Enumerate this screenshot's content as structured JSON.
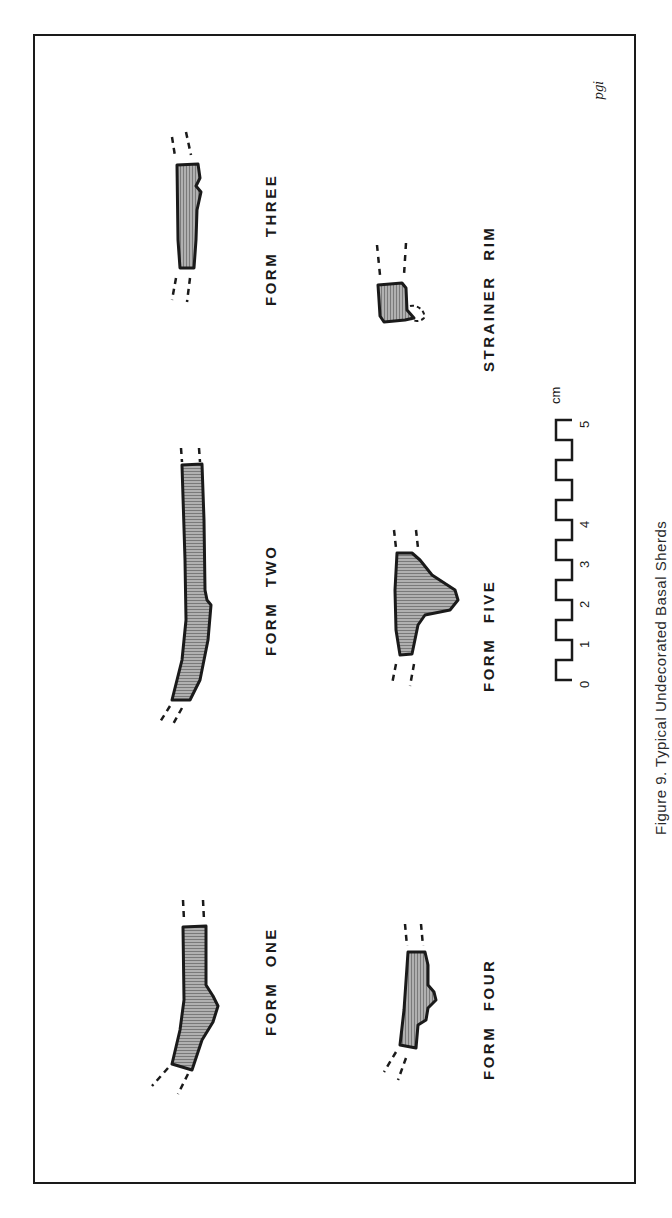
{
  "figure": {
    "caption": "Figure 9. Typical Undecorated Basal Sherds",
    "initials": "pgi",
    "orientation": "rotated 90° counter-clockwise (landscape figure on portrait page)"
  },
  "sherds": [
    {
      "id": "form-three",
      "label": "FORM THREE"
    },
    {
      "id": "form-two",
      "label": "FORM TWO"
    },
    {
      "id": "form-one",
      "label": "FORM ONE"
    },
    {
      "id": "strainer-rim",
      "label": "STRAINER RIM"
    },
    {
      "id": "form-five",
      "label": "FORM FIVE"
    },
    {
      "id": "form-four",
      "label": "FORM FOUR"
    }
  ],
  "scale_bar": {
    "unit": "cm",
    "ticks": [
      "0",
      "1",
      "2",
      "3",
      "4",
      "5"
    ]
  },
  "colors": {
    "ink": "#1a1a1a",
    "hatch_fill": "#8a8a8a",
    "background": "#ffffff"
  }
}
